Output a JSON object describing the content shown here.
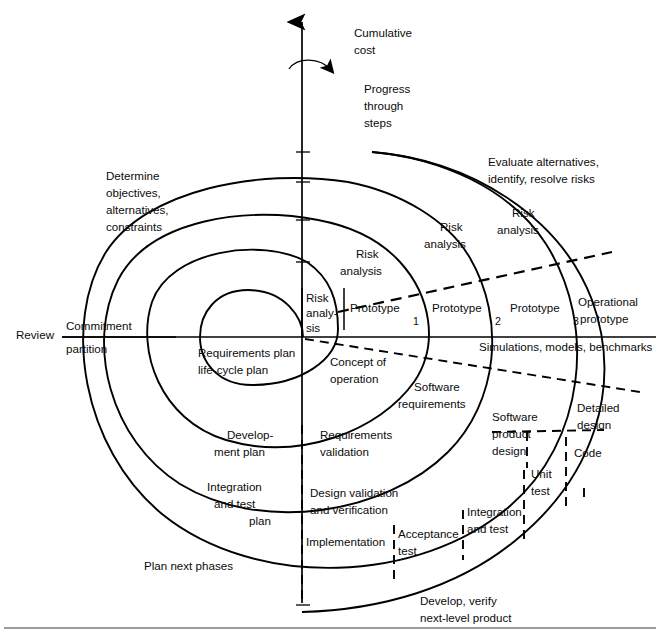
{
  "figure": {
    "axis": {
      "cumulative_cost_label": "Cumulative\ncost",
      "cumulative_cost_line1": "Cumulative",
      "cumulative_cost_line2": "cost",
      "progress_line1": "Progress",
      "progress_line2": "through",
      "progress_line3": "steps"
    },
    "quadrants": {
      "upper_left_line1": "Determine",
      "upper_left_line2": "objectives,",
      "upper_left_line3": "alternatives,",
      "upper_left_line4": "constraints",
      "upper_right_line1": "Evaluate alternatives,",
      "upper_right_line2": "identify, resolve risks",
      "lower_left": "Plan next phases",
      "lower_right_line1": "Develop, verify",
      "lower_right_line2": "next-level product"
    },
    "review_axis": {
      "review": "Review",
      "commitment": "Commitment",
      "partition": "partition"
    },
    "risk_analysis_labels": [
      {
        "line1": "Risk",
        "line2": "analy-",
        "line3": "sis"
      },
      {
        "line1": "Risk",
        "line2": "analysis"
      },
      {
        "line1": "Risk",
        "line2": "analysis"
      },
      {
        "line1": "Risk",
        "line2": "analysis"
      }
    ],
    "prototypes": [
      {
        "name": "Prototype",
        "index": "1"
      },
      {
        "name": "Prototype",
        "index": "2"
      },
      {
        "name": "Prototype",
        "index": "3"
      },
      {
        "name": "Operational",
        "index": "prototype"
      }
    ],
    "simulations": "Simulations, models, benchmarks",
    "plan_labels": [
      {
        "line1": "Requirements plan",
        "line2": "life-cycle plan"
      },
      {
        "line1": "Develop-",
        "line2": "ment plan"
      },
      {
        "line1": "Integration",
        "line2": "and test",
        "line3": "plan"
      }
    ],
    "develop_labels": [
      {
        "line1": "Concept of",
        "line2": "operation"
      },
      {
        "line1": "Software",
        "line2": "requirements"
      },
      {
        "line1": "Software",
        "line2": "product",
        "line3": "design"
      },
      {
        "line1": "Detailed",
        "line2": "design"
      },
      {
        "line1": "Code"
      }
    ],
    "verify_labels": [
      {
        "line1": "Requirements",
        "line2": "validation"
      },
      {
        "line1": "Design validation",
        "line2": "and verification"
      },
      {
        "line1": "Implementation"
      },
      {
        "line1": "Acceptance",
        "line2": "test"
      },
      {
        "line1": "Integration",
        "line2": "and test"
      },
      {
        "line1": "Unit",
        "line2": "test"
      }
    ],
    "colors": {
      "ink": "#000000",
      "paper": "#ffffff",
      "rule": "#3a3a3a"
    }
  }
}
